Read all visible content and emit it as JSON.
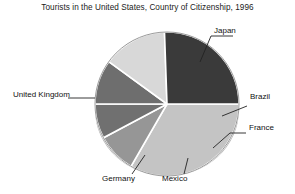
{
  "chart_data": {
    "type": "pie",
    "title": "Tourists in the United States, Country of Citizenship, 1996",
    "xlabel": "",
    "ylabel": "",
    "legend_position": "none",
    "labels_position": "outside-with-leader-lines",
    "grid": false,
    "categories": [
      "Japan",
      "Brazil",
      "France",
      "Mexico",
      "Germany",
      "United Kingdom"
    ],
    "values": [
      30,
      8,
      7,
      9,
      13,
      23
    ],
    "slices": [
      {
        "label": "Japan",
        "value": 30,
        "color": "#c4c4c4",
        "start_angle": 0,
        "end_angle": 108
      },
      {
        "label": "Brazil",
        "value": 8,
        "color": "#969696",
        "start_angle": 108,
        "end_angle": 137
      },
      {
        "label": "France",
        "value": 7,
        "color": "#707070",
        "start_angle": 137,
        "end_angle": 162
      },
      {
        "label": "Mexico",
        "value": 9,
        "color": "#6e6e6e",
        "start_angle": 162,
        "end_angle": 194
      },
      {
        "label": "Germany",
        "value": 13,
        "color": "#d8d8d8",
        "start_angle": 194,
        "end_angle": 241
      },
      {
        "label": "United Kingdom",
        "value": 23,
        "color": "#3a3a3a",
        "start_angle": 241,
        "end_angle": 360
      }
    ]
  },
  "labels": {
    "japan": "Japan",
    "brazil": "Brazil",
    "france": "France",
    "mexico": "Mexico",
    "germany": "Germany",
    "united_kingdom": "United Kingdom"
  },
  "colors": {
    "japan": "#c4c4c4",
    "brazil": "#969696",
    "france": "#707070",
    "mexico": "#6e6e6e",
    "germany": "#d8d8d8",
    "united_kingdom": "#3a3a3a",
    "pie_edge": "#9a9a9a",
    "slice_divider": "#ffffff",
    "leader_line": "#222222",
    "background": "#ffffff",
    "text": "#1a1a1a"
  }
}
